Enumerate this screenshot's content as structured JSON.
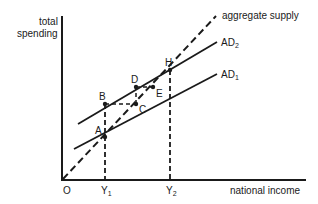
{
  "diagram": {
    "axes": {
      "y_label_line1": "total",
      "y_label_line2": "spending",
      "x_label": "national income",
      "origin": "O"
    },
    "x_ticks": [
      {
        "base": "Y",
        "sub": "1"
      },
      {
        "base": "Y",
        "sub": "2"
      }
    ],
    "lines": {
      "aggregate_supply": "aggregate supply",
      "ad2": {
        "base": "AD",
        "sub": "2"
      },
      "ad1": {
        "base": "AD",
        "sub": "1"
      }
    },
    "points": {
      "A": "A",
      "B": "B",
      "C": "C",
      "D": "D",
      "E": "E",
      "H": "H"
    },
    "colors": {
      "ink": "#1a1a1a",
      "background": "#ffffff"
    }
  }
}
